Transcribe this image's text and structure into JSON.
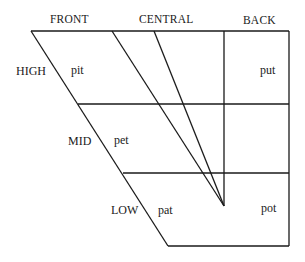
{
  "diagram": {
    "type": "vowel-quadrilateral",
    "column_headers": {
      "front": "FRONT",
      "central": "CENTRAL",
      "back": "BACK"
    },
    "row_labels": {
      "high": "HIGH",
      "mid": "MID",
      "low": "LOW"
    },
    "words": {
      "high_front": "pit",
      "high_back": "put",
      "mid_front": "pet",
      "low_front": "pat",
      "low_back": "pot"
    },
    "line_color": "#1a1a1a"
  }
}
